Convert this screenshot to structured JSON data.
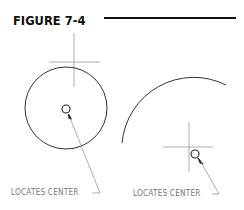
{
  "figure": {
    "title": "FIGURE 7-4"
  },
  "left_example": {
    "label": "LOCATES CENTER",
    "shape": "full-circle"
  },
  "right_example": {
    "label": "LOCATES CENTER",
    "shape": "arc"
  },
  "colors": {
    "title": "#111111",
    "geometry": "#333333",
    "crosshair": "#999999",
    "label": "#777777"
  }
}
